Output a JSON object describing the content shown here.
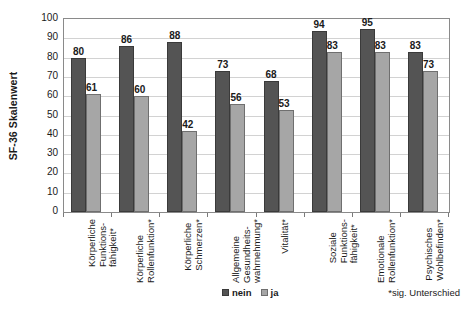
{
  "chart_data": {
    "type": "bar",
    "title": "",
    "xlabel": "",
    "ylabel": "SF-36 Skalenwert",
    "ylim": [
      0,
      100
    ],
    "ytick_step": 10,
    "yticks": [
      0,
      10,
      20,
      30,
      40,
      50,
      60,
      70,
      80,
      90,
      100
    ],
    "grid": true,
    "legend_position": "bottom-center",
    "categories": [
      "Körperliche Funktions-fähigkeit*",
      "Körperliche Rollenfunktion*",
      "Körperliche Schmerzen*",
      "Allgemeine Gesundheits-wahrnehmung*",
      "Vitalität*",
      "Soziale Funktions-fähigkeit*",
      "Emotionale Rollenfunktion*",
      "Psychisches Wohlbefinden*"
    ],
    "category_lines": [
      [
        "Körperliche",
        "Funktions-",
        "fähigkeit*"
      ],
      [
        "Körperliche",
        "Rollenfunktion*"
      ],
      [
        "Körperliche",
        "Schmerzen*"
      ],
      [
        "Allgemeine",
        "Gesundheits-",
        "wahrnehmung*"
      ],
      [
        "Vitalität*"
      ],
      [
        "Soziale",
        "Funktions-",
        "fähigkeit*"
      ],
      [
        "Emotionale",
        "Rollenfunktion*"
      ],
      [
        "Psychisches",
        "Wohlbefinden*"
      ]
    ],
    "series": [
      {
        "name": "nein",
        "color": "#545454",
        "values": [
          80,
          86,
          88,
          73,
          68,
          94,
          95,
          83
        ]
      },
      {
        "name": "ja",
        "color": "#a6a6a6",
        "values": [
          61,
          60,
          42,
          56,
          53,
          83,
          83,
          73
        ]
      }
    ],
    "annotations": [
      "*sig. Unterschied"
    ]
  },
  "legend": {
    "items": [
      {
        "label": "nein"
      },
      {
        "label": "ja"
      }
    ]
  },
  "footnote": "*sig. Unterschied"
}
